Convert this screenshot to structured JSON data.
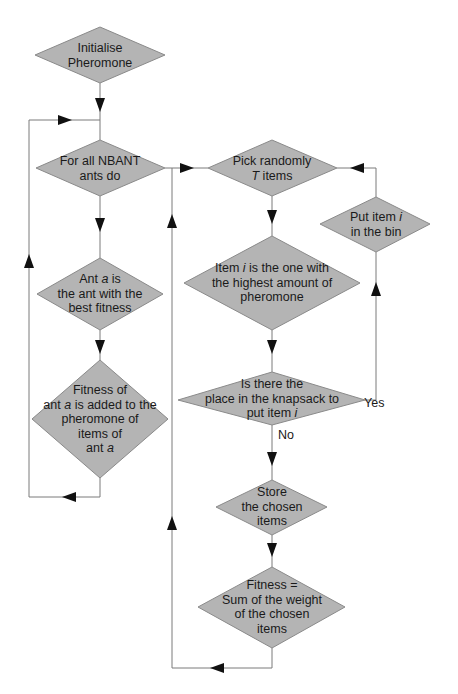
{
  "diagram": {
    "type": "flowchart",
    "colors": {
      "node_fill": "#b4b4b4",
      "node_stroke": "#8a8a8a",
      "line": "#7a7a7a",
      "arrow": "#111111",
      "text": "#1a1a1a"
    },
    "nodes": [
      {
        "id": "init",
        "lines": [
          "Initialise",
          "Pheromone"
        ]
      },
      {
        "id": "for_all",
        "lines": [
          "For all NBANT",
          "ants do"
        ]
      },
      {
        "id": "ant_a",
        "line1_pre": "Ant ",
        "line1_var": "a",
        "line1_post": " is",
        "lines": [
          "the ant with the",
          "best fitness"
        ]
      },
      {
        "id": "fitness_added",
        "line1": "Fitness of",
        "line2_pre": "ant ",
        "line2_var": "a",
        "line2_post": " is added to the",
        "line3": "pheromone of",
        "line4": "items of",
        "line5_pre": "ant ",
        "line5_var": "a"
      },
      {
        "id": "pick",
        "line1": "Pick randomly",
        "line2_var": "T",
        "line2_post": " items"
      },
      {
        "id": "put_bin",
        "line1_pre": "Put item ",
        "line1_var": "i",
        "line2": "in the bin"
      },
      {
        "id": "item_i",
        "line1_pre": "Item ",
        "line1_var": "i",
        "line1_post": " is the one with",
        "line2": "the highest amount of",
        "line3": "pheromone"
      },
      {
        "id": "is_there",
        "line1": "Is there the",
        "line2": "place in the knapsack to",
        "line3_pre": "put item ",
        "line3_var": "i"
      },
      {
        "id": "store",
        "lines": [
          "Store",
          "the chosen",
          "items"
        ]
      },
      {
        "id": "fitness_sum",
        "lines": [
          "Fitness =",
          "Sum of the weight",
          "of the chosen",
          "items"
        ]
      }
    ],
    "edge_labels": {
      "yes": "Yes",
      "no": "No"
    }
  }
}
